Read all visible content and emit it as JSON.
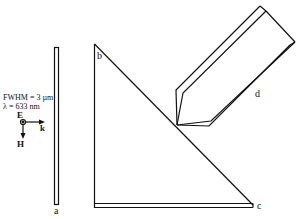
{
  "labels": {
    "a": "a",
    "b": "b",
    "c": "c",
    "d": "d"
  },
  "beam": {
    "fwhm": "FWHM = 3 µm",
    "wavelength": "λ = 633 nm",
    "E": "E",
    "k": "k",
    "H": "H"
  },
  "colors": {
    "line": "#111111",
    "background": "#ffffff"
  }
}
